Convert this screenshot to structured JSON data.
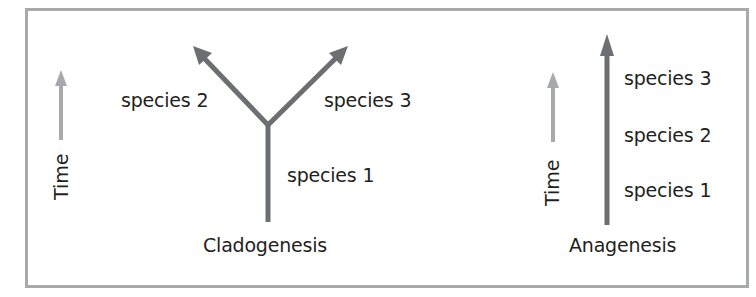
{
  "colors": {
    "frame_border": "#a7a9ab",
    "lineage_arrow": "#6d6e71",
    "time_arrow": "#a7a9ab",
    "text": "#231f20"
  },
  "cladogenesis": {
    "title": "Cladogenesis",
    "time_label": "Time",
    "species": [
      "species 1",
      "species 2",
      "species 3"
    ]
  },
  "anagenesis": {
    "title": "Anagenesis",
    "time_label": "Time",
    "species": [
      "species 3",
      "species 2",
      "species 1"
    ]
  }
}
